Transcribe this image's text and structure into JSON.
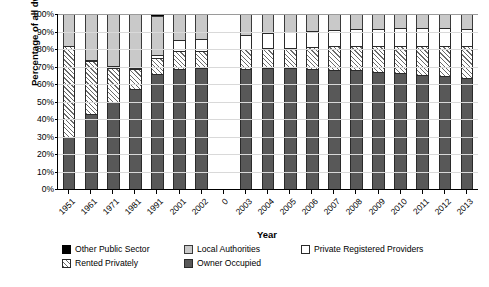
{
  "chart_data": {
    "type": "bar",
    "subtype": "stacked-percentage-column",
    "title": "",
    "xlabel": "Year",
    "ylabel": "Percentage of all dwellings",
    "ylim": [
      0,
      100
    ],
    "yticks": [
      "0%",
      "10%",
      "20%",
      "30%",
      "40%",
      "50%",
      "60%",
      "70%",
      "80%",
      "90%",
      "100%"
    ],
    "ytick_values": [
      0,
      10,
      20,
      30,
      40,
      50,
      60,
      70,
      80,
      90,
      100
    ],
    "grid": true,
    "legend_position": "bottom",
    "categories": [
      "1951",
      "1961",
      "1971",
      "1981",
      "1991",
      "2001",
      "2002",
      "0",
      "2003",
      "2004",
      "2005",
      "2006",
      "2007",
      "2008",
      "2009",
      "2010",
      "2011",
      "2012",
      "2013"
    ],
    "series": [
      {
        "name": "Owner Occupied",
        "color": "#585858",
        "pattern": "solid-dark-grey",
        "values": [
          29.5,
          42.8,
          49.5,
          57.0,
          65.8,
          68.8,
          69.0,
          0,
          68.5,
          69.0,
          69.0,
          68.3,
          68.2,
          67.8,
          67.0,
          66.2,
          65.2,
          64.3,
          63.5
        ]
      },
      {
        "name": "Rented Privately",
        "color": "#ffffff",
        "pattern": "diagonal-hatch",
        "values": [
          52.0,
          30.3,
          19.8,
          11.5,
          9.0,
          9.8,
          9.8,
          0,
          11.3,
          11.5,
          11.8,
          12.8,
          13.3,
          13.8,
          14.7,
          15.5,
          16.5,
          17.5,
          18.0
        ]
      },
      {
        "name": "Private Registered Providers",
        "color": "#ffffff",
        "pattern": "open-white",
        "values": [
          0,
          0.6,
          0.9,
          0.9,
          1.5,
          6.8,
          7.2,
          0,
          8.2,
          8.8,
          9.2,
          9.4,
          9.6,
          9.8,
          9.8,
          10.1,
          10.1,
          10.2,
          10.0
        ]
      },
      {
        "name": "Local Authorities",
        "color": "#c9c9c9",
        "pattern": "solid-light-grey",
        "values": [
          18.5,
          26.3,
          29.8,
          30.6,
          22.7,
          14.6,
          14.0,
          0,
          12.0,
          10.7,
          10.0,
          9.5,
          8.9,
          8.6,
          8.5,
          8.2,
          8.2,
          8.0,
          8.5
        ]
      },
      {
        "name": "Other Public Sector",
        "color": "#000000",
        "pattern": "solid-black",
        "values": [
          0,
          0,
          0,
          0,
          1.0,
          0,
          0,
          0,
          0,
          0,
          0,
          0,
          0,
          0,
          0,
          0,
          0,
          0,
          0
        ]
      }
    ]
  },
  "legend": {
    "row1": [
      {
        "label": "Other Public Sector",
        "swatch": "ops"
      },
      {
        "label": "Local Authorities",
        "swatch": "la"
      },
      {
        "label": "Private Registered Providers",
        "swatch": "prp"
      }
    ],
    "row2": [
      {
        "label": "Rented Privately",
        "swatch": "rented"
      },
      {
        "label": "Owner Occupied",
        "swatch": "owner"
      }
    ]
  }
}
